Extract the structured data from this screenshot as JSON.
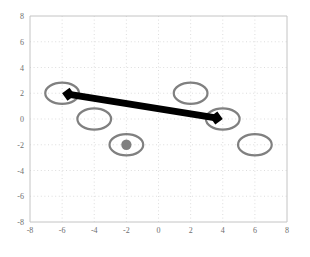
{
  "chart_data": {
    "type": "scatter",
    "title": "",
    "xlabel": "",
    "ylabel": "",
    "xlim": [
      -8,
      8
    ],
    "ylim": [
      -8,
      8
    ],
    "grid": true,
    "grid_style": "dotted",
    "grid_color": "#d9d9d9",
    "legend": "none",
    "background": "#ffffff",
    "axis_color": "#c8c8c8",
    "xticks": [
      "-8",
      "-6",
      "-4",
      "-2",
      "0",
      "2",
      "4",
      "6",
      "8"
    ],
    "xtick_values": [
      -8,
      -6,
      -4,
      -2,
      0,
      2,
      4,
      6,
      8
    ],
    "yticks": [
      "8",
      "6",
      "4",
      "2",
      "0",
      "-2",
      "-4",
      "-6",
      "-8"
    ],
    "ytick_values": [
      8,
      6,
      4,
      2,
      0,
      -2,
      -4,
      -6,
      -8
    ],
    "series": [
      {
        "name": "ellipses",
        "marker": "ellipse-outline",
        "color": "#808080",
        "linewidth": 2.2,
        "rx": 1.05,
        "ry": 0.82,
        "points": [
          {
            "x": -6,
            "y": 2,
            "filled_center": false
          },
          {
            "x": -4,
            "y": 0,
            "filled_center": false
          },
          {
            "x": -2,
            "y": -2,
            "filled_center": true
          },
          {
            "x": 2,
            "y": 2,
            "filled_center": false
          },
          {
            "x": 4,
            "y": 0,
            "filled_center": false
          },
          {
            "x": 6,
            "y": -2,
            "filled_center": false
          }
        ]
      },
      {
        "name": "center-dot",
        "marker": "filled-circle",
        "color": "#808080",
        "radius": 0.32,
        "points": [
          {
            "x": -2,
            "y": -2
          }
        ]
      },
      {
        "name": "double-arrow",
        "marker": "arrow",
        "color": "#000000",
        "linewidth": 7,
        "arrow_heads": "both",
        "start": {
          "x": -6,
          "y": 2
        },
        "end": {
          "x": 4,
          "y": 0
        }
      }
    ]
  },
  "figure": {
    "caption": ""
  }
}
